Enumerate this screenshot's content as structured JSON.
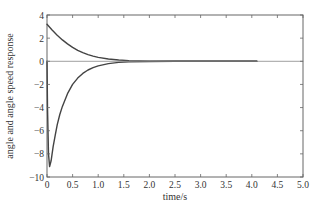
{
  "chart_data": {
    "type": "line",
    "title": "",
    "xlabel": "time/s",
    "ylabel": "angle and angle speed response",
    "xlim": [
      0,
      5.0
    ],
    "ylim": [
      -10,
      4
    ],
    "xticks": [
      "0",
      "0.5",
      "1.0",
      "1.5",
      "2.0",
      "2.5",
      "3.0",
      "3.5",
      "4.0",
      "4.5",
      "5.0"
    ],
    "xtick_values": [
      0,
      0.5,
      1.0,
      1.5,
      2.0,
      2.5,
      3.0,
      3.5,
      4.0,
      4.5,
      5.0
    ],
    "yticks": [
      "4",
      "2",
      "0",
      "-2",
      "-4",
      "-6",
      "-8",
      "-10"
    ],
    "ytick_values": [
      4,
      2,
      0,
      -2,
      -4,
      -6,
      -8,
      -10
    ],
    "grid": false,
    "legend": null,
    "series": [
      {
        "name": "angle",
        "x": [
          0,
          0.1,
          0.2,
          0.3,
          0.4,
          0.5,
          0.6,
          0.7,
          0.8,
          0.9,
          1.0,
          1.2,
          1.4,
          1.6,
          1.8,
          2.0,
          2.5,
          3.0,
          3.5,
          4.1
        ],
        "values": [
          3.2,
          2.7,
          2.25,
          1.85,
          1.5,
          1.2,
          0.95,
          0.75,
          0.58,
          0.45,
          0.34,
          0.2,
          0.11,
          0.06,
          0.03,
          0.02,
          0.0,
          0.0,
          0.0,
          0.0
        ]
      },
      {
        "name": "angle speed",
        "x": [
          0,
          0.01,
          0.03,
          0.05,
          0.08,
          0.12,
          0.16,
          0.2,
          0.25,
          0.3,
          0.4,
          0.5,
          0.6,
          0.7,
          0.8,
          0.9,
          1.0,
          1.2,
          1.4,
          1.6,
          2.0,
          2.5,
          3.0,
          3.5,
          4.1
        ],
        "values": [
          0,
          -4.0,
          -8.0,
          -9.1,
          -8.6,
          -7.4,
          -6.4,
          -5.5,
          -4.6,
          -3.9,
          -2.8,
          -2.0,
          -1.45,
          -1.05,
          -0.75,
          -0.55,
          -0.4,
          -0.2,
          -0.1,
          -0.05,
          -0.02,
          0.0,
          0.0,
          0.0,
          0.0
        ]
      },
      {
        "name": "zero reference",
        "x": [
          0,
          5.0
        ],
        "values": [
          0,
          0
        ]
      }
    ]
  }
}
